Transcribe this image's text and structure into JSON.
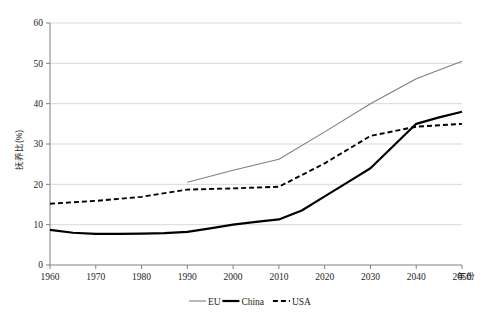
{
  "chart_data": {
    "type": "line",
    "title": "",
    "xlabel": "年份",
    "ylabel": "抚养比(%)",
    "xlim": [
      1960,
      2050
    ],
    "ylim": [
      0,
      60
    ],
    "grid": true,
    "legend_position": "bottom",
    "x": [
      1960,
      1970,
      1980,
      1990,
      2000,
      2010,
      2020,
      2030,
      2040,
      2050
    ],
    "xticks": [
      "1960",
      "1970",
      "1980",
      "1990",
      "2000",
      "2010",
      "2020",
      "2030",
      "2040",
      "2050"
    ],
    "yticks": [
      "0",
      "10",
      "20",
      "30",
      "40",
      "50",
      "60"
    ],
    "series": [
      {
        "name": "EU",
        "style": "solid-thin",
        "color": "#7f7f7f",
        "x": [
          1990,
          2000,
          2010,
          2020,
          2030,
          2040,
          2050
        ],
        "values": [
          20.5,
          23.5,
          26.2,
          33.0,
          40.0,
          46.2,
          50.5
        ]
      },
      {
        "name": "China",
        "style": "solid-thick",
        "color": "#000000",
        "x": [
          1960,
          1965,
          1970,
          1975,
          1980,
          1985,
          1990,
          1995,
          2000,
          2005,
          2010,
          2015,
          2020,
          2025,
          2030,
          2035,
          2040,
          2045,
          2050
        ],
        "values": [
          8.7,
          8.0,
          7.7,
          7.7,
          7.8,
          7.9,
          8.2,
          9.1,
          10.0,
          10.7,
          11.3,
          13.5,
          17.0,
          20.5,
          24.0,
          29.5,
          35.0,
          36.6,
          38.0
        ]
      },
      {
        "name": "USA",
        "style": "dashed",
        "color": "#000000",
        "x": [
          1960,
          1970,
          1980,
          1990,
          2000,
          2010,
          2020,
          2030,
          2040,
          2050
        ],
        "values": [
          15.2,
          15.9,
          16.9,
          18.7,
          19.0,
          19.4,
          25.2,
          32.0,
          34.3,
          35.0
        ]
      }
    ]
  },
  "axes": {
    "y_title": "抚养比(%)",
    "x_title": "年份",
    "y_ticks": [
      {
        "label": "60",
        "value": 60
      },
      {
        "label": "50",
        "value": 50
      },
      {
        "label": "40",
        "value": 40
      },
      {
        "label": "30",
        "value": 30
      },
      {
        "label": "20",
        "value": 20
      },
      {
        "label": "10",
        "value": 10
      },
      {
        "label": "0",
        "value": 0
      }
    ],
    "x_ticks": [
      {
        "label": "1960",
        "value": 1960
      },
      {
        "label": "1970",
        "value": 1970
      },
      {
        "label": "1980",
        "value": 1980
      },
      {
        "label": "1990",
        "value": 1990
      },
      {
        "label": "2000",
        "value": 2000
      },
      {
        "label": "2010",
        "value": 2010
      },
      {
        "label": "2020",
        "value": 2020
      },
      {
        "label": "2030",
        "value": 2030
      },
      {
        "label": "2040",
        "value": 2040
      },
      {
        "label": "2050",
        "value": 2050
      }
    ]
  },
  "legend": {
    "items": [
      {
        "label": "EU",
        "style": "solid-thin",
        "color": "#7f7f7f"
      },
      {
        "label": "China",
        "style": "solid-thick",
        "color": "#000000"
      },
      {
        "label": "USA",
        "style": "dashed",
        "color": "#000000"
      }
    ]
  },
  "colors": {
    "gridline": "#d9d9d9",
    "axis": "#808080",
    "eu": "#7f7f7f",
    "china": "#000000",
    "usa": "#000000",
    "background": "#ffffff"
  }
}
